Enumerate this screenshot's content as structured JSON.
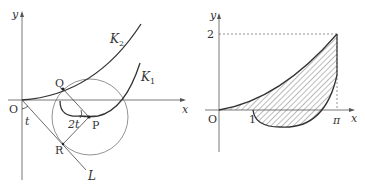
{
  "left_figure": {
    "axes": {
      "x_label": "x",
      "y_label": "y",
      "origin_label": "O"
    },
    "curves": [
      {
        "name": "K2",
        "label": "K",
        "subscript": "2"
      },
      {
        "name": "K1",
        "label": "K",
        "subscript": "1"
      }
    ],
    "points": {
      "Q": "Q",
      "P": "P",
      "R": "R"
    },
    "line_label": "L",
    "angles": {
      "t": "t",
      "two_t": "2t"
    }
  },
  "right_figure": {
    "axes": {
      "x_label": "x",
      "y_label": "y",
      "origin_label": "O"
    },
    "ticks": {
      "y_tick": "2",
      "x_tick_1": "1",
      "x_tick_pi": "π"
    },
    "shading": "hatched"
  },
  "colors": {
    "stroke": "#333333",
    "circle": "#666666",
    "hatch": "#555555"
  }
}
